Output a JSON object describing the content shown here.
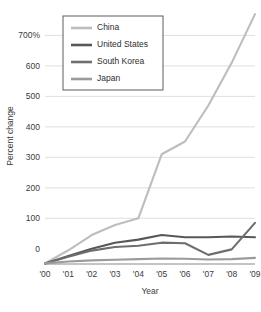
{
  "chart_data": {
    "type": "line",
    "title": "",
    "xlabel": "Year",
    "ylabel": "Percent change",
    "x": [
      "'00",
      "'01",
      "'02",
      "'03",
      "'04",
      "'05",
      "'06",
      "'07",
      "'08",
      "'09"
    ],
    "xlim": [
      0,
      9
    ],
    "ylim": [
      -50,
      790
    ],
    "yticks": [
      0,
      100,
      200,
      300,
      400,
      500,
      600,
      700
    ],
    "ytick_labels": [
      "0",
      "100",
      "200",
      "300",
      "400",
      "500",
      "600",
      "700%"
    ],
    "grid": true,
    "legend_position": "top-left-inside",
    "series": [
      {
        "name": "China",
        "color": "#bdbdbd",
        "values": [
          -48,
          -5,
          45,
          78,
          100,
          310,
          352,
          470,
          610,
          770
        ]
      },
      {
        "name": "United States",
        "color": "#585858",
        "values": [
          -48,
          -24,
          0,
          20,
          30,
          45,
          38,
          38,
          40,
          38
        ]
      },
      {
        "name": "South Korea",
        "color": "#6e6e6e",
        "values": [
          -48,
          -26,
          -6,
          6,
          10,
          20,
          18,
          -20,
          -2,
          85
        ]
      },
      {
        "name": "Japan",
        "color": "#9b9b9b",
        "values": [
          -48,
          -42,
          -38,
          -36,
          -34,
          -32,
          -33,
          -35,
          -34,
          -30
        ]
      }
    ]
  }
}
